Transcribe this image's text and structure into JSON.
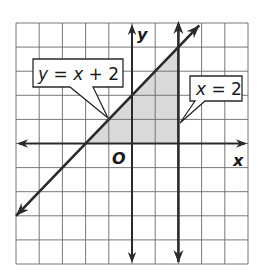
{
  "figure": {
    "type": "coordinate-graph",
    "axes": {
      "x_label": "x",
      "y_label": "y",
      "origin_label": "O",
      "x_range": [
        -5,
        5
      ],
      "y_range": [
        -5,
        5
      ],
      "grid": true,
      "grid_step": 1
    },
    "lines": [
      {
        "id": "line-y-eq-x-plus-2",
        "equation": "y = x + 2",
        "slope": 1,
        "intercept": 2,
        "arrows": "both"
      },
      {
        "id": "line-x-eq-2",
        "equation": "x = 2",
        "vertical_x": 2,
        "arrows": "both"
      }
    ],
    "shaded_region": {
      "description": "Triangle bounded by y = x + 2, x = 2, and the x-axis",
      "vertices": [
        [
          -2,
          0
        ],
        [
          2,
          0
        ],
        [
          2,
          4
        ]
      ],
      "color": "#d9d9d9"
    },
    "callouts": [
      {
        "id": "callout-line1",
        "text_parts": [
          "y",
          " = ",
          "x",
          " + 2"
        ],
        "points_to": [
          -1,
          1
        ]
      },
      {
        "id": "callout-line2",
        "text_parts": [
          "x",
          " = 2"
        ],
        "points_to": [
          2,
          1
        ]
      }
    ]
  },
  "colors": {
    "line": "#2a2a2a",
    "grid": "#6a6a6a",
    "shade": "#d9d9d9",
    "background": "#ffffff"
  }
}
